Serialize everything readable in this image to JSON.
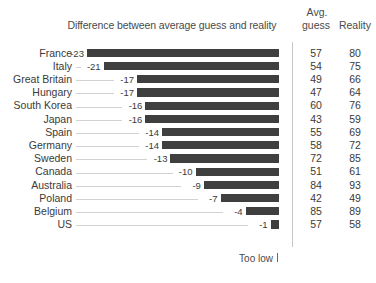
{
  "header": {
    "title": "Difference between average guess and reality",
    "avg_line1": "Avg.",
    "avg_line2": "guess",
    "reality": "Reality"
  },
  "footnote": {
    "label": "Too low",
    "tick_icon": "axis-tick-icon"
  },
  "style": {
    "bar_color": "#3f3f3f",
    "text_color": "#3a3a3a",
    "leader_color": "#d2d2d2",
    "divider_color": "#c6c6c6",
    "background": "#ffffff"
  },
  "chart_data": {
    "type": "bar",
    "orientation": "horizontal",
    "title": "Difference between average guess and reality",
    "xlabel": "",
    "ylabel": "",
    "annotation": "Too low",
    "grid": false,
    "legend": false,
    "xlim": [
      -24,
      0
    ],
    "baseline": 0,
    "categories": [
      "France",
      "Italy",
      "Great Britain",
      "Hungary",
      "South Korea",
      "Japan",
      "Spain",
      "Germany",
      "Sweden",
      "Canada",
      "Australia",
      "Poland",
      "Belgium",
      "US"
    ],
    "values": [
      -23,
      -21,
      -17,
      -17,
      -16,
      -16,
      -14,
      -14,
      -13,
      -10,
      -9,
      -7,
      -4,
      -1
    ],
    "value_labels": [
      "-23",
      "-21",
      "-17",
      "-17",
      "-16",
      "-16",
      "-14",
      "-14",
      "-13",
      "-10",
      "-9",
      "-7",
      "-4",
      "-1"
    ],
    "extra_columns": [
      {
        "name": "Avg. guess",
        "values": [
          57,
          54,
          49,
          47,
          60,
          43,
          55,
          58,
          72,
          51,
          84,
          42,
          85,
          57
        ]
      },
      {
        "name": "Reality",
        "values": [
          80,
          75,
          66,
          64,
          76,
          59,
          69,
          72,
          85,
          61,
          93,
          49,
          89,
          58
        ]
      }
    ],
    "rows": [
      {
        "category": "France",
        "value": -23,
        "value_label": "-23",
        "avg_guess": "57",
        "reality": "80"
      },
      {
        "category": "Italy",
        "value": -21,
        "value_label": "-21",
        "avg_guess": "54",
        "reality": "75"
      },
      {
        "category": "Great Britain",
        "value": -17,
        "value_label": "-17",
        "avg_guess": "49",
        "reality": "66"
      },
      {
        "category": "Hungary",
        "value": -17,
        "value_label": "-17",
        "avg_guess": "47",
        "reality": "64"
      },
      {
        "category": "South Korea",
        "value": -16,
        "value_label": "-16",
        "avg_guess": "60",
        "reality": "76"
      },
      {
        "category": "Japan",
        "value": -16,
        "value_label": "-16",
        "avg_guess": "43",
        "reality": "59"
      },
      {
        "category": "Spain",
        "value": -14,
        "value_label": "-14",
        "avg_guess": "55",
        "reality": "69"
      },
      {
        "category": "Germany",
        "value": -14,
        "value_label": "-14",
        "avg_guess": "58",
        "reality": "72"
      },
      {
        "category": "Sweden",
        "value": -13,
        "value_label": "-13",
        "avg_guess": "72",
        "reality": "85"
      },
      {
        "category": "Canada",
        "value": -10,
        "value_label": "-10",
        "avg_guess": "51",
        "reality": "61"
      },
      {
        "category": "Australia",
        "value": -9,
        "value_label": "-9",
        "avg_guess": "84",
        "reality": "93"
      },
      {
        "category": "Poland",
        "value": -7,
        "value_label": "-7",
        "avg_guess": "42",
        "reality": "49"
      },
      {
        "category": "Belgium",
        "value": -4,
        "value_label": "-4",
        "avg_guess": "85",
        "reality": "89"
      },
      {
        "category": "US",
        "value": -1,
        "value_label": "-1",
        "avg_guess": "57",
        "reality": "58"
      }
    ]
  }
}
